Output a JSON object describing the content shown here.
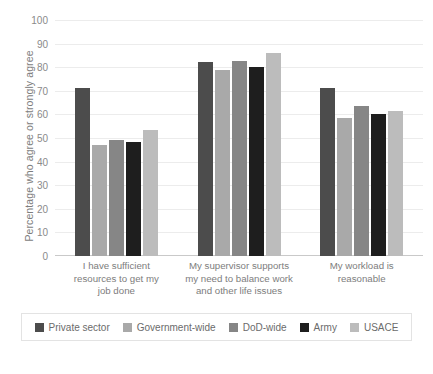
{
  "chart_data": {
    "type": "bar",
    "title": "",
    "xlabel": "",
    "ylabel": "Percentage who agree or strongly agree",
    "ylim": [
      0,
      100
    ],
    "yticks": [
      100,
      90,
      80,
      70,
      60,
      50,
      40,
      30,
      20,
      10,
      0
    ],
    "grid": true,
    "legend_position": "bottom",
    "categories": [
      "I have sufficient resources to get my job done",
      "My supervisor supports my need to balance work and other life issues",
      "My workload is reasonable"
    ],
    "category_label_lines": [
      [
        "I have sufficient",
        "resources to get my",
        "job done"
      ],
      [
        "My supervisor supports",
        "my need to balance work",
        "and other life issues"
      ],
      [
        "My workload is",
        "reasonable"
      ]
    ],
    "series": [
      {
        "name": "Private sector",
        "color": "#4c4c4c",
        "values": [
          71,
          82,
          71
        ]
      },
      {
        "name": "Government-wide",
        "color": "#a9a9a9",
        "values": [
          47,
          79,
          58.5
        ]
      },
      {
        "name": "DoD-wide",
        "color": "#868686",
        "values": [
          49,
          82.5,
          63.5
        ]
      },
      {
        "name": "Army",
        "color": "#1e1e1e",
        "values": [
          48.5,
          80,
          60
        ]
      },
      {
        "name": "USACE",
        "color": "#bcbcbc",
        "values": [
          53.5,
          86,
          61.5
        ]
      }
    ]
  },
  "caption": {
    "text": ""
  }
}
